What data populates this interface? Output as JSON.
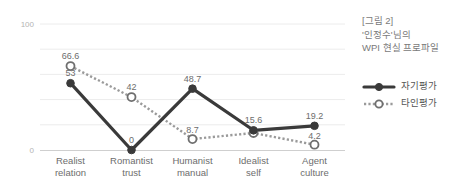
{
  "chart_data": {
    "type": "line",
    "title": "[그림 2] '인정수'님의 WPI 현실 프로파일",
    "title_lines": [
      "[그림 2]",
      "'인정수'님의",
      "WPI 현실 프로파일"
    ],
    "categories": [
      "Realist relation",
      "Romantist trust",
      "Humanist manual",
      "Idealist self",
      "Agent culture"
    ],
    "category_lines": [
      [
        "Realist",
        "relation"
      ],
      [
        "Romantist",
        "trust"
      ],
      [
        "Humanist",
        "manual"
      ],
      [
        "Idealist",
        "self"
      ],
      [
        "Agent",
        "culture"
      ]
    ],
    "series": [
      {
        "name": "자기평가",
        "style": "solid",
        "marker": "filled-circle",
        "color": "#3a3a3a",
        "values": [
          53,
          0,
          48.7,
          15.6,
          19.2
        ],
        "labels": [
          "53",
          "0",
          "48.7",
          "15.6",
          "19.2"
        ]
      },
      {
        "name": "타인평가",
        "style": "dotted",
        "marker": "hollow-circle",
        "color": "#9a9a9a",
        "values": [
          66.6,
          42,
          8.7,
          13.5,
          4.2
        ],
        "labels": [
          "66.6",
          "42",
          "8.7",
          "",
          "4.2"
        ]
      }
    ],
    "ylim": [
      0,
      100
    ],
    "yticks": [
      0,
      100
    ],
    "ytick_labels": [
      "0",
      "100"
    ],
    "gridlines": [
      0,
      20,
      40,
      60,
      80,
      100
    ],
    "xlabel": "",
    "ylabel": "",
    "grid": true,
    "legend_position": "right"
  },
  "legend": {
    "items": [
      {
        "label": "자기평가"
      },
      {
        "label": "타인평가"
      }
    ]
  },
  "axis": {
    "y_top_label": "100",
    "y_bottom_label": "0"
  },
  "colors": {
    "self_line": "#3a3a3a",
    "other_line": "#9a9a9a",
    "grid": "#ececec",
    "text": "#6d6d6d",
    "tick": "#b4b4b4"
  }
}
